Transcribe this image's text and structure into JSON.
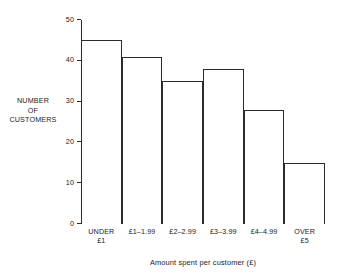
{
  "chart_data": {
    "type": "bar",
    "title": "",
    "categories": [
      "UNDER £1",
      "£1–1.99",
      "£2–2.99",
      "£3–3.99",
      "£4–4.99",
      "OVER £5"
    ],
    "category_lines": [
      [
        "UNDER",
        "£1"
      ],
      [
        "£1–1.99"
      ],
      [
        "£2–2.99"
      ],
      [
        "£3–3.99"
      ],
      [
        "£4–4.99"
      ],
      [
        "OVER",
        "£5"
      ]
    ],
    "values": [
      45,
      41,
      35,
      38,
      28,
      15
    ],
    "xlabel": "Amount spent per customer (£)",
    "ylabel": "NUMBER OF CUSTOMERS",
    "ylabel_lines": [
      "NUMBER",
      "OF",
      "CUSTOMERS"
    ],
    "ylim": [
      0,
      50
    ],
    "yticks": [
      0,
      10,
      20,
      30,
      40,
      50
    ],
    "ytick_labels": [
      "0",
      "10",
      "20",
      "30",
      "40",
      "50"
    ],
    "grid": false,
    "legend": false,
    "bar_fill": "#ffffff",
    "bar_stroke": "#2b2b2b",
    "axis_color": "#2b2b2b",
    "background": "#ffffff"
  }
}
